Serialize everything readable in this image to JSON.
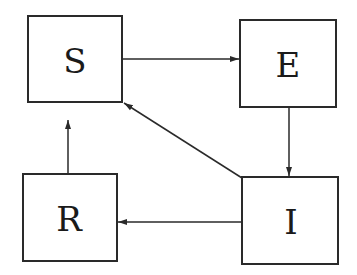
{
  "diagram": {
    "type": "compartmental-model",
    "nodes": [
      {
        "id": "S",
        "label": "S"
      },
      {
        "id": "E",
        "label": "E"
      },
      {
        "id": "I",
        "label": "I"
      },
      {
        "id": "R",
        "label": "R"
      }
    ],
    "edges": [
      {
        "from": "S",
        "to": "E"
      },
      {
        "from": "E",
        "to": "I"
      },
      {
        "from": "I",
        "to": "R"
      },
      {
        "from": "R",
        "to": "S"
      },
      {
        "from": "I",
        "to": "S"
      }
    ],
    "colors": {
      "stroke": "#2a2a2a",
      "text": "#1a1a1a",
      "background": "#ffffff"
    }
  }
}
